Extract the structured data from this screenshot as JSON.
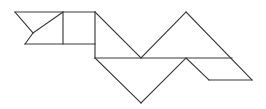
{
  "figure": {
    "kind": "line-drawing",
    "canvas": {
      "width": 266,
      "height": 109,
      "background": "#ffffff"
    },
    "style": {
      "stroke_color": "#3b3b3b",
      "stroke_width": 1.15,
      "fill": "none"
    },
    "pieces": [
      {
        "name": "small-triangle-upper-left",
        "shape": "triangle",
        "points": "15,12 63,12 33,33"
      },
      {
        "name": "small-triangle-lower-left",
        "shape": "triangle",
        "points": "33,33 63,12 63,44"
      },
      {
        "name": "triangle-left-base",
        "shape": "triangle",
        "points": "33,33 63,44 25,44"
      },
      {
        "name": "square-center-left",
        "shape": "quadrilateral",
        "points": "63,12 95,12 95,44 63,44"
      },
      {
        "name": "large-triangle-upper-middle",
        "shape": "triangle",
        "points": "95,12 141,58 95,58"
      },
      {
        "name": "large-triangle-upper-right",
        "shape": "triangle",
        "points": "141,58 186,12 232,58"
      },
      {
        "name": "large-triangle-lower-middle",
        "shape": "triangle",
        "points": "95,58 141,103 186,58"
      },
      {
        "name": "parallelogram-lower-right",
        "shape": "quadrilateral",
        "points": "186,58 232,58 252,80 209,80"
      }
    ],
    "segments": [
      {
        "name": "top-edge-left",
        "x1": 15,
        "y1": 12,
        "x2": 95,
        "y2": 12
      },
      {
        "name": "diagonal-upper-left-down",
        "x1": 15,
        "y1": 12,
        "x2": 33,
        "y2": 33
      },
      {
        "name": "diagonal-inner-left-up",
        "x1": 33,
        "y1": 33,
        "x2": 63,
        "y2": 12
      },
      {
        "name": "diagonal-left-base-down",
        "x1": 33,
        "y1": 33,
        "x2": 25,
        "y2": 44
      },
      {
        "name": "bottom-edge-left",
        "x1": 25,
        "y1": 44,
        "x2": 95,
        "y2": 44
      },
      {
        "name": "vertical-square-left",
        "x1": 63,
        "y1": 12,
        "x2": 63,
        "y2": 44
      },
      {
        "name": "vertical-square-right",
        "x1": 95,
        "y1": 12,
        "x2": 95,
        "y2": 58
      },
      {
        "name": "diagonal-big-v-left",
        "x1": 95,
        "y1": 12,
        "x2": 141,
        "y2": 58
      },
      {
        "name": "diagonal-big-v-right-up",
        "x1": 141,
        "y1": 58,
        "x2": 186,
        "y2": 12
      },
      {
        "name": "diagonal-peak-right-down",
        "x1": 186,
        "y1": 12,
        "x2": 252,
        "y2": 80
      },
      {
        "name": "horizontal-mid",
        "x1": 95,
        "y1": 58,
        "x2": 232,
        "y2": 58
      },
      {
        "name": "diagonal-lower-v-left",
        "x1": 95,
        "y1": 58,
        "x2": 141,
        "y2": 103
      },
      {
        "name": "diagonal-lower-v-right",
        "x1": 141,
        "y1": 103,
        "x2": 186,
        "y2": 58
      },
      {
        "name": "diagonal-parallelogram-left",
        "x1": 186,
        "y1": 58,
        "x2": 209,
        "y2": 80
      },
      {
        "name": "bottom-edge-right",
        "x1": 209,
        "y1": 80,
        "x2": 252,
        "y2": 80
      }
    ]
  }
}
